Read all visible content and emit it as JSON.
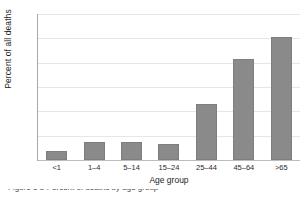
{
  "chart_data": {
    "type": "bar",
    "title": "",
    "categories": [
      "<1",
      "1–4",
      "5–14",
      "15–24",
      "25–44",
      "45–64",
      ">65"
    ],
    "values": [
      1.9,
      3.8,
      3.6,
      3.2,
      11.5,
      20.7,
      25.3
    ],
    "xlabel": "Age group",
    "ylabel": "Percent of all deaths",
    "ylim": [
      0,
      30
    ],
    "ytick_labels": [
      "0",
      "5",
      "10",
      "15",
      "20",
      "25",
      "30"
    ],
    "ytick_values": [
      0,
      5,
      10,
      15,
      20,
      25,
      30
    ],
    "grid": "horizontal",
    "legend": "none",
    "bar_color": "#8a8a8a",
    "gridline_color": "#e6e6e6",
    "axis_color": "#a8a8a8",
    "background_color": "#ffffff"
  },
  "caption": {
    "label": "Figure 1-2",
    "text": "Figure 1-2  Percent of deaths by age group"
  }
}
